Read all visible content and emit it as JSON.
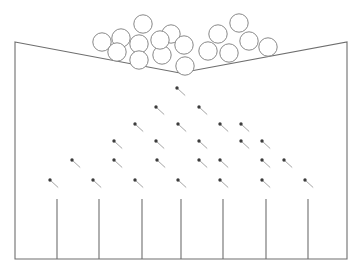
{
  "diagram": {
    "type": "galton-board",
    "canvas": {
      "width": 362,
      "height": 272
    },
    "background_color": "#ffffff",
    "stroke_color": "#6e6e6e",
    "ball_stroke_color": "#7a7a7a",
    "ball_fill_color": "#ffffff",
    "pin_stem_color": "#9a9a9a",
    "pin_head_color": "#3c3c3c"
  },
  "frame": {
    "name": "hopper-and-bin-frame",
    "points": "15,42 15,259 347,259 347,42 347,42 180,73 15,42",
    "path": "M 15 42 L 180 73 L 347 42 L 347 259 L 15 259 Z",
    "left_wall_x": 15,
    "right_wall_x": 347,
    "top_y": 42,
    "bottom_y": 259,
    "notch_apex_x": 180,
    "notch_apex_y": 73
  },
  "balls": {
    "name": "ball-reservoir",
    "count": 17,
    "radius": 9.2,
    "items": [
      {
        "cx": 102,
        "cy": 42
      },
      {
        "cx": 121,
        "cy": 38
      },
      {
        "cx": 143,
        "cy": 24
      },
      {
        "cx": 139,
        "cy": 44
      },
      {
        "cx": 117,
        "cy": 52
      },
      {
        "cx": 139,
        "cy": 60
      },
      {
        "cx": 162,
        "cy": 55
      },
      {
        "cx": 171,
        "cy": 34
      },
      {
        "cx": 184,
        "cy": 45
      },
      {
        "cx": 185,
        "cy": 66
      },
      {
        "cx": 208,
        "cy": 51
      },
      {
        "cx": 229,
        "cy": 53
      },
      {
        "cx": 218,
        "cy": 34
      },
      {
        "cx": 239,
        "cy": 23
      },
      {
        "cx": 249,
        "cy": 41
      },
      {
        "cx": 268,
        "cy": 47
      },
      {
        "cx": 160,
        "cy": 40
      }
    ]
  },
  "pins": {
    "name": "pin-array",
    "rows": 6,
    "total": 27,
    "row_spacing": 20,
    "column_spacing": 42.5,
    "pin_length": 11,
    "head_radius": 1.7,
    "rows_data": [
      {
        "row": 1,
        "count": 1,
        "y": 88,
        "xs": [
          177
        ]
      },
      {
        "row": 2,
        "count": 2,
        "y": 107,
        "xs": [
          156,
          199
        ]
      },
      {
        "row": 3,
        "count": 3,
        "y": 124,
        "xs": [
          135,
          178,
          220
        ]
      },
      {
        "row": 4,
        "count": 4,
        "y": 141,
        "xs": [
          114,
          156,
          199,
          241
        ]
      },
      {
        "row": 5,
        "count": 5,
        "y": 160,
        "xs": [
          72,
          114,
          157,
          199,
          262
        ]
      },
      {
        "row": 6,
        "count": 7,
        "y": 180,
        "xs": [
          50,
          93,
          135,
          178,
          220,
          262,
          305
        ]
      }
    ],
    "extra_pins": [
      {
        "x": 241,
        "y": 124
      },
      {
        "x": 262,
        "y": 141
      },
      {
        "x": 284,
        "y": 160
      },
      {
        "x": 220,
        "y": 160
      }
    ]
  },
  "bins": {
    "name": "collection-bins",
    "count": 8,
    "divider_count": 7,
    "divider_top_y": 199,
    "divider_bottom_y": 259,
    "divider_xs": [
      57,
      99,
      142,
      181,
      223,
      266,
      308
    ]
  }
}
